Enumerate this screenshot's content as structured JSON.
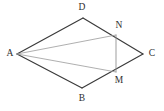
{
  "figure": {
    "background_color": "#ffffff",
    "stroke_color_main": "#3a3a3a",
    "stroke_color_light": "#9a9a9a",
    "label_color": "#2e2e2e",
    "width": 164,
    "height": 111
  },
  "points": {
    "A": {
      "label": "A",
      "x": 17,
      "y": 54,
      "label_x": 10,
      "label_y": 54
    },
    "B": {
      "label": "B",
      "x": 82,
      "y": 88,
      "label_x": 82,
      "label_y": 99
    },
    "C": {
      "label": "C",
      "x": 143,
      "y": 54,
      "label_x": 152,
      "label_y": 54
    },
    "D": {
      "label": "D",
      "x": 83,
      "y": 18,
      "label_x": 82,
      "label_y": 8
    },
    "M": {
      "label": "M",
      "x": 116,
      "y": 72,
      "label_x": 119,
      "label_y": 81
    },
    "N": {
      "label": "N",
      "x": 116,
      "y": 35,
      "label_x": 119,
      "label_y": 26
    }
  },
  "segments": [
    {
      "name": "A-D",
      "from": "A",
      "to": "D",
      "style": "main"
    },
    {
      "name": "D-C",
      "from": "D",
      "to": "C",
      "style": "main"
    },
    {
      "name": "A-B",
      "from": "A",
      "to": "B",
      "style": "main"
    },
    {
      "name": "B-C",
      "from": "B",
      "to": "C",
      "style": "main"
    },
    {
      "name": "N-M",
      "from": "N",
      "to": "M",
      "style": "chord"
    },
    {
      "name": "A-N",
      "from": "A",
      "to": "N",
      "style": "cevian"
    },
    {
      "name": "A-M",
      "from": "A",
      "to": "M",
      "style": "cevian"
    }
  ],
  "labels": [
    "D",
    "N",
    "A",
    "C",
    "M",
    "B"
  ]
}
